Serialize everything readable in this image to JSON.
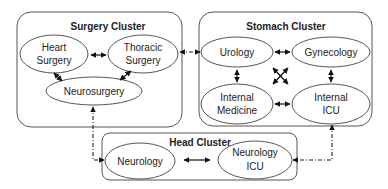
{
  "clusters": {
    "surgery": {
      "title": "Surgery Cluster"
    },
    "stomach": {
      "title": "Stomach Cluster"
    },
    "head": {
      "title": "Head Cluster"
    }
  },
  "nodes": {
    "heart_surgery": {
      "line1": "Heart",
      "line2": "Surgery"
    },
    "thoracic_surgery": {
      "line1": "Thoracic",
      "line2": "Surgery"
    },
    "neurosurgery": {
      "label": "Neurosurgery"
    },
    "urology": {
      "label": "Urology"
    },
    "gynecology": {
      "label": "Gynecology"
    },
    "internal_medicine": {
      "line1": "Internal",
      "line2": "Medicine"
    },
    "internal_icu": {
      "line1": "Internal",
      "line2": "ICU"
    },
    "neurology": {
      "label": "Neurology"
    },
    "neurology_icu": {
      "line1": "Neurology",
      "line2": "ICU"
    }
  },
  "edges": {
    "intra_cluster_bidirectional": [
      [
        "Heart Surgery",
        "Thoracic Surgery"
      ],
      [
        "Heart Surgery",
        "Neurosurgery"
      ],
      [
        "Thoracic Surgery",
        "Neurosurgery"
      ],
      [
        "Urology",
        "Gynecology"
      ],
      [
        "Urology",
        "Internal Medicine"
      ],
      [
        "Urology",
        "Internal ICU"
      ],
      [
        "Gynecology",
        "Internal Medicine"
      ],
      [
        "Gynecology",
        "Internal ICU"
      ],
      [
        "Internal Medicine",
        "Internal ICU"
      ],
      [
        "Neurology",
        "Neurology ICU"
      ]
    ],
    "inter_cluster_bidirectional_dashdot": [
      [
        "Thoracic Surgery",
        "Urology"
      ],
      [
        "Neurosurgery",
        "Neurology"
      ],
      [
        "Internal ICU",
        "Neurology ICU"
      ]
    ]
  },
  "colors": {
    "stroke": "#555555",
    "edge": "#111111",
    "background": "#ffffff"
  }
}
